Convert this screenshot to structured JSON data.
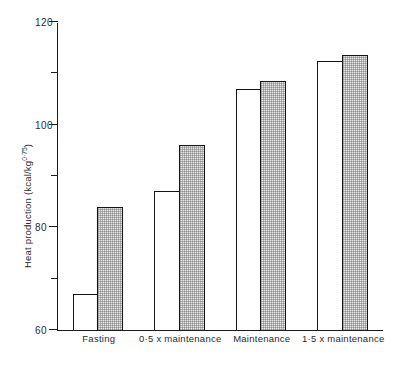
{
  "chart_data": {
    "type": "bar",
    "title": "",
    "subtitle": "",
    "xlabel": "",
    "ylabel": "Heat production (kcal/kg",
    "ylabel_exponent": "0·75",
    "ylabel_close": ")",
    "ylabel_full": "Heat production (kcal/kg0·75)",
    "categories": [
      "Fasting",
      "0·5 x maintenance",
      "Maintenance",
      "1·5 x maintenance"
    ],
    "series": [
      {
        "name": "open",
        "values": [
          67,
          87,
          107,
          112.5
        ]
      },
      {
        "name": "stippled",
        "values": [
          84,
          96,
          108.5,
          113.5
        ]
      }
    ],
    "ylim": [
      60,
      120
    ],
    "yticks_major": [
      120,
      100,
      80,
      60
    ],
    "yticks_minor": [
      110,
      90,
      70
    ],
    "ytick_labels": [
      "120",
      "100",
      "80",
      "60"
    ],
    "grid": false,
    "legend": "none",
    "colors": {
      "open_fill": "#ffffff",
      "stippled_fill": "#e9e9e9",
      "outline": "#141414",
      "axis": "#1c1c1c",
      "text": "#2b2b2b"
    }
  }
}
